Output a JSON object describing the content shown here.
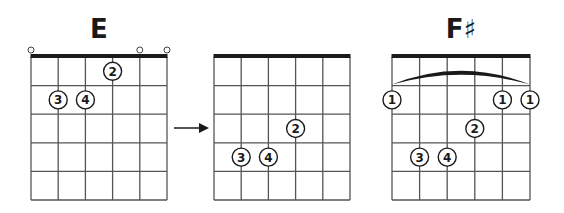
{
  "diagrams": [
    {
      "id": "E",
      "title": "E",
      "grid": {
        "x": 31,
        "y": 57,
        "width": 136,
        "height": 143,
        "strings": 6,
        "frets": 5
      },
      "open_strings": [
        6,
        2,
        1
      ],
      "barre": null,
      "fingers": [
        {
          "finger": "2",
          "string": 3,
          "fret": 1
        },
        {
          "finger": "3",
          "string": 5,
          "fret": 2
        },
        {
          "finger": "4",
          "string": 4,
          "fret": 2
        }
      ]
    },
    {
      "id": "E-shape-moved",
      "title": "",
      "grid": {
        "x": 214,
        "y": 57,
        "width": 136,
        "height": 143,
        "strings": 6,
        "frets": 5
      },
      "open_strings": [],
      "barre": null,
      "fingers": [
        {
          "finger": "2",
          "string": 3,
          "fret": 3
        },
        {
          "finger": "3",
          "string": 5,
          "fret": 4
        },
        {
          "finger": "4",
          "string": 4,
          "fret": 4
        }
      ]
    },
    {
      "id": "Fsharp",
      "title": "F♯",
      "grid": {
        "x": 392,
        "y": 57,
        "width": 138,
        "height": 143,
        "strings": 6,
        "frets": 5
      },
      "open_strings": [],
      "barre": {
        "fret": 2,
        "from_string": 6,
        "to_string": 1
      },
      "fingers": [
        {
          "finger": "1",
          "string": 6,
          "fret": 2
        },
        {
          "finger": "1",
          "string": 2,
          "fret": 2
        },
        {
          "finger": "1",
          "string": 1,
          "fret": 2
        },
        {
          "finger": "2",
          "string": 3,
          "fret": 3
        },
        {
          "finger": "3",
          "string": 5,
          "fret": 4
        },
        {
          "finger": "4",
          "string": 4,
          "fret": 4
        }
      ]
    }
  ],
  "arrow": {
    "x1": 174,
    "x2": 209,
    "y": 128,
    "label": "move-right-arrow"
  }
}
